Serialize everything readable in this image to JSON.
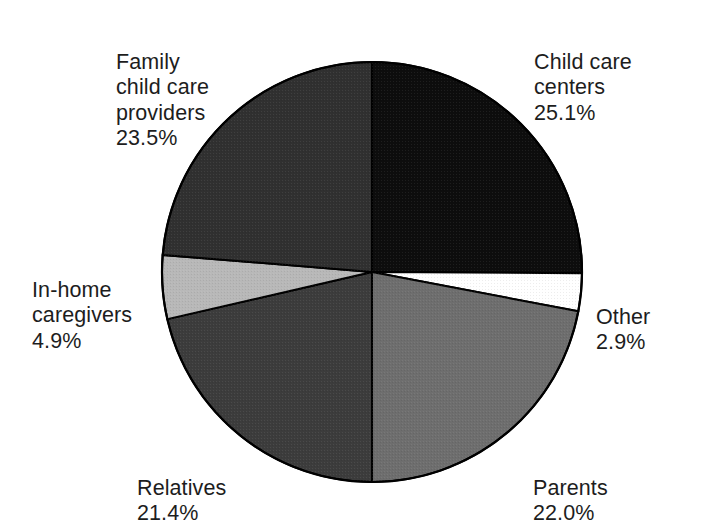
{
  "chart_data": {
    "type": "pie",
    "title": "",
    "subtitle": "",
    "xlabel": "",
    "ylabel": "",
    "legend_position": "none",
    "grid": false,
    "units": "percent",
    "start_angle_deg": 0,
    "direction": "clockwise",
    "center": {
      "x": 372,
      "y": 272
    },
    "radius": 210,
    "categories": [
      "Child care centers",
      "Other",
      "Parents",
      "Relatives",
      "In-home caregivers",
      "Family child care providers"
    ],
    "values": [
      25.1,
      2.9,
      22.0,
      21.4,
      4.9,
      23.5
    ],
    "slices": [
      {
        "name": "child-care-centers",
        "label": "Child care centers",
        "value": 25.1,
        "value_text": "25.1%",
        "color": "#0d0d0d",
        "start_deg": 0,
        "end_deg": 90.36
      },
      {
        "name": "other",
        "label": "Other",
        "value": 2.9,
        "value_text": "2.9%",
        "color": "#ffffff",
        "start_deg": 90.36,
        "end_deg": 100.8
      },
      {
        "name": "parents",
        "label": "Parents",
        "value": 22.0,
        "value_text": "22.0%",
        "color": "#6e6e6e",
        "start_deg": 100.8,
        "end_deg": 179.99
      },
      {
        "name": "relatives",
        "label": "Relatives",
        "value": 21.4,
        "value_text": "21.4%",
        "color": "#3c3c3c",
        "start_deg": 179.99,
        "end_deg": 257.03
      },
      {
        "name": "in-home-caregivers",
        "label": "In-home caregivers",
        "value": 4.9,
        "value_text": "4.9%",
        "color": "#b8b8b8",
        "start_deg": 257.03,
        "end_deg": 274.67
      },
      {
        "name": "family-child-care-providers",
        "label": "Family child care providers",
        "value": 23.5,
        "value_text": "23.5%",
        "color": "#303030",
        "start_deg": 274.67,
        "end_deg": 360
      }
    ],
    "outline_color": "#000000",
    "background": "#ffffff"
  },
  "labels": {
    "family": {
      "text": "Family\nchild care\nproviders",
      "value": "23.5%"
    },
    "centers": {
      "text": "Child care\ncenters",
      "value": "25.1%"
    },
    "other": {
      "text": "Other",
      "value": "2.9%"
    },
    "parents": {
      "text": "Parents",
      "value": "22.0%"
    },
    "relatives": {
      "text": "Relatives",
      "value": "21.4%"
    },
    "inhome": {
      "text": "In-home\ncaregivers",
      "value": "4.9%"
    }
  }
}
